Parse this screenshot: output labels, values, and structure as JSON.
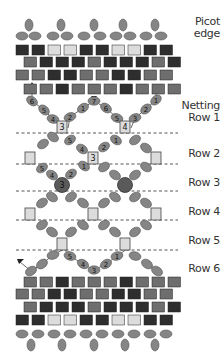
{
  "colors": {
    "dark": "#2e2e2e",
    "medium": "#6e6e6e",
    "light": "#dcdcdc",
    "oval": "#858585",
    "oval_stroke": "#555555",
    "round": "#5a5a5a",
    "line": "#444444",
    "dash": "#555555"
  },
  "labels": {
    "picot_line1": "Picot",
    "picot_line2": "edge",
    "netting_line1": "Netting",
    "row1": "Row 1",
    "row2": "Row 2",
    "row3": "Row 3",
    "row4": "Row 4",
    "row5": "Row 5",
    "row6": "Row 6"
  },
  "brick_rows_top": [
    {
      "y": 45,
      "x0": 16,
      "pattern": [
        "D",
        "D",
        "L",
        "L",
        "D",
        "D",
        "L",
        "L",
        "D",
        "D"
      ]
    },
    {
      "y": 57,
      "x0": 24,
      "pattern": [
        "M",
        "D",
        "D",
        "D",
        "M",
        "D",
        "D",
        "D",
        "M",
        "D"
      ]
    },
    {
      "y": 70,
      "x0": 16,
      "pattern": [
        "M",
        "M",
        "D",
        "D",
        "M",
        "M",
        "D",
        "D",
        "M",
        "M"
      ]
    },
    {
      "y": 84,
      "x0": 24,
      "pattern": [
        "M",
        "M",
        "D",
        "M",
        "M",
        "M",
        "D",
        "M",
        "M",
        "M"
      ]
    }
  ],
  "brick_rows_bottom": [
    {
      "y": 277,
      "x0": 24,
      "pattern": [
        "M",
        "M",
        "D",
        "M",
        "M",
        "M",
        "D",
        "M",
        "M",
        "M"
      ]
    },
    {
      "y": 289,
      "x0": 16,
      "pattern": [
        "M",
        "M",
        "D",
        "D",
        "M",
        "M",
        "D",
        "D",
        "M",
        "M"
      ]
    },
    {
      "y": 302,
      "x0": 24,
      "pattern": [
        "M",
        "D",
        "D",
        "D",
        "M",
        "D",
        "D",
        "D",
        "M",
        "D"
      ]
    },
    {
      "y": 315,
      "x0": 16,
      "pattern": [
        "D",
        "D",
        "L",
        "L",
        "D",
        "D",
        "L",
        "L",
        "D",
        "D"
      ]
    }
  ],
  "netting": {
    "row1_beads": [
      {
        "x": 32,
        "y": 101,
        "n": "6"
      },
      {
        "x": 44,
        "y": 110,
        "n": "5"
      },
      {
        "x": 53,
        "y": 119,
        "n": "4"
      },
      {
        "x": 70,
        "y": 117,
        "n": "2"
      },
      {
        "x": 83,
        "y": 108,
        "n": "1"
      },
      {
        "x": 94,
        "y": 101,
        "n": "7"
      },
      {
        "x": 106,
        "y": 108,
        "n": "6"
      },
      {
        "x": 117,
        "y": 118,
        "n": "5"
      },
      {
        "x": 135,
        "y": 118,
        "n": "3"
      },
      {
        "x": 146,
        "y": 109,
        "n": "2"
      },
      {
        "x": 156,
        "y": 100,
        "n": "1"
      }
    ],
    "row1_squares": [
      {
        "x": 62,
        "y": 127,
        "n": "3"
      },
      {
        "x": 125,
        "y": 127,
        "n": "4"
      }
    ],
    "row2_beads": [
      {
        "x": 43,
        "y": 144,
        "n": ""
      },
      {
        "x": 53,
        "y": 137,
        "n": ""
      },
      {
        "x": 70,
        "y": 140,
        "n": "5"
      },
      {
        "x": 82,
        "y": 149,
        "n": "4"
      },
      {
        "x": 104,
        "y": 147,
        "n": "2"
      },
      {
        "x": 116,
        "y": 140,
        "n": "1"
      },
      {
        "x": 135,
        "y": 140,
        "n": ""
      },
      {
        "x": 146,
        "y": 148,
        "n": ""
      }
    ],
    "row2_squares": [
      {
        "x": 30,
        "y": 158,
        "n": ""
      },
      {
        "x": 93,
        "y": 158,
        "n": "3"
      },
      {
        "x": 156,
        "y": 158,
        "n": ""
      }
    ],
    "row3_beads": [
      {
        "x": 42,
        "y": 168,
        "n": "5"
      },
      {
        "x": 52,
        "y": 175,
        "n": "4"
      },
      {
        "x": 71,
        "y": 174,
        "n": "2"
      },
      {
        "x": 84,
        "y": 166,
        "n": "1"
      },
      {
        "x": 104,
        "y": 167,
        "n": ""
      },
      {
        "x": 115,
        "y": 175,
        "n": ""
      },
      {
        "x": 135,
        "y": 175,
        "n": ""
      },
      {
        "x": 146,
        "y": 167,
        "n": ""
      }
    ],
    "row3_rounds": [
      {
        "x": 62,
        "y": 185,
        "n": "3"
      },
      {
        "x": 125,
        "y": 185,
        "n": ""
      }
    ],
    "row4_beads": [
      {
        "x": 42,
        "y": 203,
        "n": ""
      },
      {
        "x": 52,
        "y": 197,
        "n": ""
      },
      {
        "x": 71,
        "y": 197,
        "n": ""
      },
      {
        "x": 83,
        "y": 203,
        "n": ""
      },
      {
        "x": 104,
        "y": 203,
        "n": ""
      },
      {
        "x": 115,
        "y": 197,
        "n": ""
      },
      {
        "x": 135,
        "y": 197,
        "n": ""
      },
      {
        "x": 146,
        "y": 203,
        "n": ""
      }
    ],
    "row4_squares": [
      {
        "x": 30,
        "y": 214,
        "n": ""
      },
      {
        "x": 93,
        "y": 214,
        "n": ""
      },
      {
        "x": 156,
        "y": 214,
        "n": ""
      }
    ],
    "row5_beads": [
      {
        "x": 42,
        "y": 225,
        "n": ""
      },
      {
        "x": 52,
        "y": 232,
        "n": ""
      },
      {
        "x": 71,
        "y": 232,
        "n": ""
      },
      {
        "x": 83,
        "y": 225,
        "n": ""
      },
      {
        "x": 104,
        "y": 225,
        "n": ""
      },
      {
        "x": 115,
        "y": 232,
        "n": ""
      },
      {
        "x": 135,
        "y": 232,
        "n": ""
      },
      {
        "x": 146,
        "y": 225,
        "n": ""
      }
    ],
    "row5_squares": [
      {
        "x": 62,
        "y": 244,
        "n": ""
      },
      {
        "x": 125,
        "y": 244,
        "n": ""
      }
    ],
    "row6_beads": [
      {
        "x": 31,
        "y": 271,
        "n": ""
      },
      {
        "x": 42,
        "y": 264,
        "n": ""
      },
      {
        "x": 53,
        "y": 255,
        "n": ""
      },
      {
        "x": 70,
        "y": 256,
        "n": "5"
      },
      {
        "x": 83,
        "y": 264,
        "n": "4"
      },
      {
        "x": 94,
        "y": 270,
        "n": "3"
      },
      {
        "x": 106,
        "y": 264,
        "n": "2"
      },
      {
        "x": 117,
        "y": 256,
        "n": "1"
      },
      {
        "x": 135,
        "y": 256,
        "n": ""
      },
      {
        "x": 147,
        "y": 264,
        "n": ""
      },
      {
        "x": 157,
        "y": 271,
        "n": ""
      }
    ]
  },
  "picot_top": {
    "vertical_x": [
      29,
      61,
      94,
      123,
      155
    ],
    "horizontal": [
      [
        22,
        36
      ],
      [
        35,
        36
      ],
      [
        53,
        36
      ],
      [
        67,
        36
      ],
      [
        84,
        36
      ],
      [
        100,
        36
      ],
      [
        116,
        36
      ],
      [
        130,
        36
      ],
      [
        146,
        36
      ],
      [
        161,
        36
      ]
    ]
  },
  "picot_bottom": {
    "vertical_x": [
      31,
      62,
      94,
      125,
      155
    ],
    "horizontal": [
      [
        22,
        334
      ],
      [
        38,
        334
      ],
      [
        54,
        334
      ],
      [
        70,
        334
      ],
      [
        86,
        334
      ],
      [
        102,
        334
      ],
      [
        118,
        334
      ],
      [
        134,
        334
      ],
      [
        150,
        334
      ],
      [
        166,
        334
      ]
    ]
  }
}
